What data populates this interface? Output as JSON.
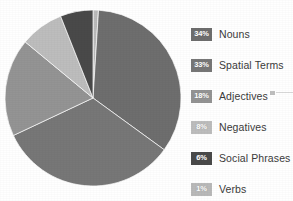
{
  "chart_data": {
    "type": "pie",
    "title": "",
    "subtitle": "",
    "xlabel": "",
    "ylabel": "",
    "grid": false,
    "legend_position": "right",
    "start_angle_deg": 0,
    "direction": "clockwise",
    "center": {
      "x": 93,
      "y": 98
    },
    "radius": 88,
    "categories": [
      "Nouns",
      "Spatial Terms",
      "Adjectives",
      "Negatives",
      "Social Phrases",
      "Verbs"
    ],
    "values": [
      34,
      33,
      18,
      8,
      6,
      1
    ],
    "value_unit": "%",
    "slices": [
      {
        "label": "Verbs",
        "value": 1,
        "value_label": "1%",
        "color": "#b9b9b9",
        "order": 1
      },
      {
        "label": "Nouns",
        "value": 34,
        "value_label": "34%",
        "color": "#6e6e6e",
        "order": 2
      },
      {
        "label": "Spatial Terms",
        "value": 33,
        "value_label": "33%",
        "color": "#777777",
        "order": 3
      },
      {
        "label": "Adjectives",
        "value": 18,
        "value_label": "18%",
        "color": "#949494",
        "order": 4
      },
      {
        "label": "Negatives",
        "value": 8,
        "value_label": "8%",
        "color": "#bdbdbd",
        "order": 5
      },
      {
        "label": "Social Phrases",
        "value": 6,
        "value_label": "6%",
        "color": "#494949",
        "order": 6
      }
    ]
  },
  "legend": {
    "rows": [
      {
        "value_label": "34%",
        "label": "Nouns",
        "swatch_color": "#6e6e6e",
        "top": 5
      },
      {
        "value_label": "33%",
        "label": "Spatial Terms",
        "swatch_color": "#777777",
        "top": 36
      },
      {
        "value_label": "18%",
        "label": "Adjectives",
        "swatch_color": "#949494",
        "top": 67
      },
      {
        "value_label": "8%",
        "label": "Negatives",
        "swatch_color": "#bdbdbd",
        "top": 98
      },
      {
        "value_label": "6%",
        "label": "Social Phrases",
        "swatch_color": "#494949",
        "top": 129
      },
      {
        "value_label": "1%",
        "label": "Verbs",
        "swatch_color": "#b9b9b9",
        "top": 160
      }
    ]
  },
  "colors": {
    "page_background": "#ffffff",
    "label_text": "#3b3b3b",
    "swatch_text": "#ffffff",
    "pie_edge": "#ffffff"
  }
}
